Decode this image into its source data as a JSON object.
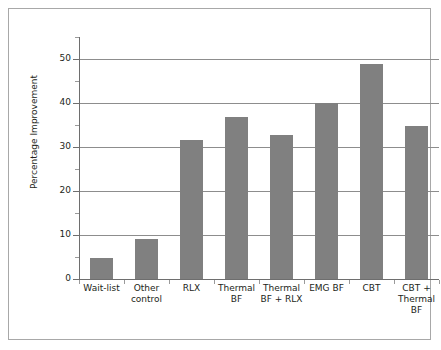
{
  "chart_data": {
    "type": "bar",
    "title": "",
    "xlabel": "",
    "ylabel": "Percentage Improvement",
    "categories": [
      "Wait-list",
      "Other\ncontrol",
      "RLX",
      "Thermal\nBF",
      "Thermal\nBF + RLX",
      "EMG BF",
      "CBT",
      "CBT +\nThermal\nBF"
    ],
    "values": [
      4.8,
      9.0,
      31.7,
      36.8,
      32.7,
      40.0,
      48.9,
      34.8
    ],
    "ylim": [
      0,
      55
    ],
    "y_major_ticks": [
      0,
      10,
      20,
      30,
      40,
      50
    ],
    "y_major_tick_labels": [
      "0",
      "10",
      "20",
      "30",
      "40",
      "50"
    ],
    "y_minor_ticks": [
      5,
      15,
      25,
      35,
      45,
      55
    ],
    "grid": "horizontal-major",
    "legend": "none",
    "bar_color": "#808080",
    "grid_color": "#8d8d8d",
    "axis_color": "#6e6e6e",
    "text_color": "#231f20",
    "frame_color": "#a8a8a8"
  }
}
